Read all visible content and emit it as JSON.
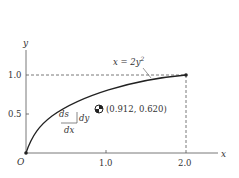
{
  "diagram": {
    "axes": {
      "x_label": "x",
      "y_label": "y",
      "origin_label": "O"
    },
    "x_ticks": [
      "1.0",
      "2.0"
    ],
    "y_ticks": [
      "0.5",
      "1.0"
    ],
    "curve": {
      "equation_lhs": "x = 2y",
      "equation_exp": "2",
      "end_point": [
        2.0,
        1.0
      ]
    },
    "element_labels": {
      "ds": "ds",
      "dy": "dy",
      "dx": "dx"
    },
    "centroid": {
      "label": "(0.912, 0.620)",
      "x": 0.912,
      "y": 0.62
    }
  }
}
